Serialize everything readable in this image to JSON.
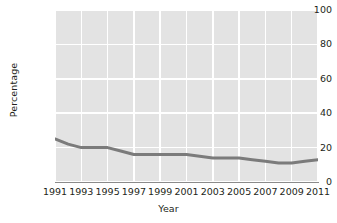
{
  "chart_data": {
    "type": "line",
    "title": "",
    "xlabel": "Year",
    "ylabel": "Percentage",
    "xlim": [
      1991,
      2011
    ],
    "ylim": [
      0,
      100
    ],
    "grid": true,
    "legend_position": "none",
    "xticks": [
      1991,
      1993,
      1995,
      1997,
      1999,
      2001,
      2003,
      2005,
      2007,
      2009,
      2011
    ],
    "yticks": [
      0,
      20,
      40,
      60,
      80,
      100
    ],
    "x": [
      1991,
      1992,
      1993,
      1994,
      1995,
      1996,
      1997,
      1998,
      1999,
      2000,
      2001,
      2002,
      2003,
      2004,
      2005,
      2006,
      2007,
      2008,
      2009,
      2010,
      2011
    ],
    "series": [
      {
        "name": "Percentage",
        "color": "#7b7b7b",
        "values": [
          25,
          22,
          20,
          20,
          20,
          18,
          16,
          16,
          16,
          16,
          16,
          15,
          14,
          14,
          14,
          13,
          12,
          11,
          11,
          12,
          13
        ]
      }
    ]
  },
  "axes": {
    "y_title": "Percentage",
    "x_title": "Year",
    "y_tick_labels": [
      "100",
      "80",
      "60",
      "40",
      "20",
      "0"
    ],
    "x_tick_labels": [
      "1991",
      "1993",
      "1995",
      "1997",
      "1999",
      "2001",
      "2003",
      "2005",
      "2007",
      "2009",
      "2011"
    ]
  },
  "style": {
    "panel_background": "#e3e3e3",
    "grid_color": "#ffffff",
    "line_color": "#7b7b7b",
    "axis_color": "#8b8b8b",
    "text_color": "#231f20",
    "page_background": "#ffffff"
  }
}
